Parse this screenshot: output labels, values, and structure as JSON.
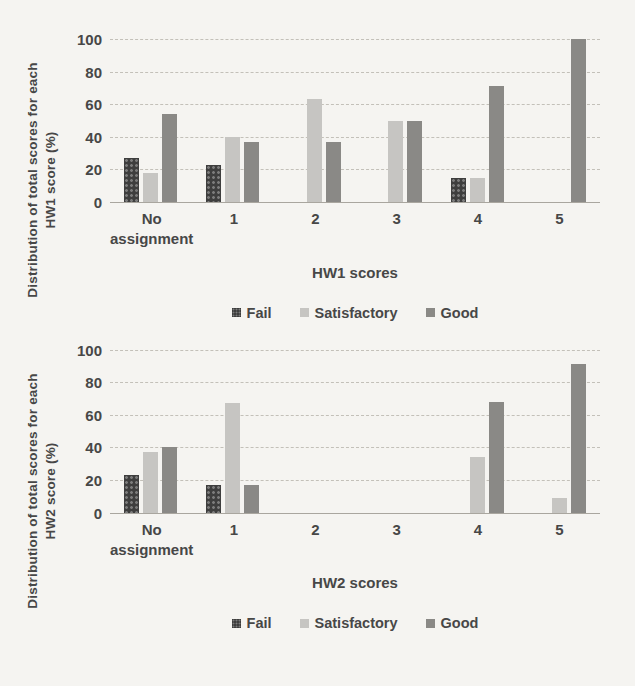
{
  "page": {
    "background": "#f5f4f1"
  },
  "palette": {
    "fail": "#3e3e3e",
    "satisfactory": "#c6c5c2",
    "good": "#8a8986",
    "gridline": "#c3c0b9",
    "axis_line": "#a9a69f",
    "text": "#474747"
  },
  "chart_data": [
    {
      "type": "bar",
      "title": "",
      "ylabel": "Distribution of total scores for each HW1 score (%)",
      "xlabel": "HW1 scores",
      "categories": [
        "No assignment",
        "1",
        "2",
        "3",
        "4",
        "5"
      ],
      "series": [
        {
          "name": "Fail",
          "values": [
            27,
            23,
            0,
            0,
            15,
            0
          ]
        },
        {
          "name": "Satisfactory",
          "values": [
            18,
            40,
            63,
            50,
            15,
            0
          ]
        },
        {
          "name": "Good",
          "values": [
            54,
            37,
            37,
            50,
            71,
            100
          ]
        }
      ],
      "ylim": [
        0,
        100
      ],
      "yticks": [
        0,
        20,
        40,
        60,
        80,
        100
      ],
      "grid": true,
      "legend": [
        "Fail",
        "Satisfactory",
        "Good"
      ],
      "legend_position": "bottom"
    },
    {
      "type": "bar",
      "title": "",
      "ylabel": "Distribution of total scores for each HW2 score (%)",
      "xlabel": "HW2 scores",
      "categories": [
        "No assignment",
        "1",
        "2",
        "3",
        "4",
        "5"
      ],
      "series": [
        {
          "name": "Fail",
          "values": [
            23,
            17,
            0,
            0,
            0,
            0
          ]
        },
        {
          "name": "Satisfactory",
          "values": [
            37,
            67,
            0,
            0,
            34,
            9
          ]
        },
        {
          "name": "Good",
          "values": [
            40,
            17,
            0,
            0,
            68,
            91
          ]
        }
      ],
      "ylim": [
        0,
        100
      ],
      "yticks": [
        0,
        20,
        40,
        60,
        80,
        100
      ],
      "grid": true,
      "legend": [
        "Fail",
        "Satisfactory",
        "Good"
      ],
      "legend_position": "bottom"
    }
  ]
}
